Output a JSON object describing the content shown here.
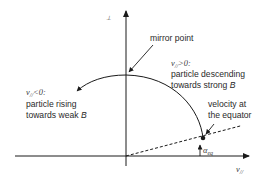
{
  "diagram": {
    "axes": {
      "y_label": "v⊥",
      "y_label_main": "v",
      "y_label_sub": "⊥",
      "x_label_main": "v",
      "x_label_sub": "//"
    },
    "labels": {
      "mirror_point": "mirror point",
      "right_condition_main": "v",
      "right_condition_sub": "//",
      "right_condition_rel": ">0:",
      "right_line1": "particle descending",
      "right_line2_prefix": "towards strong ",
      "right_line2_B": "B",
      "left_condition_main": "v",
      "left_condition_sub": "//",
      "left_condition_rel": "<0:",
      "left_line1": "particle rising",
      "left_line2_prefix": "towards weak ",
      "left_line2_B": "B",
      "equator_line1": "velocity at",
      "equator_line2": "the equator",
      "alpha_main": "α",
      "alpha_sub": "eq"
    },
    "colors": {
      "ink": "#1a1a1a",
      "text": "#2a2a2a"
    }
  }
}
